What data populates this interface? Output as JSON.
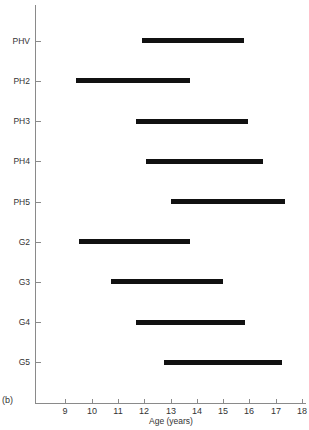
{
  "chart_data": {
    "type": "bar",
    "orientation": "horizontal-range",
    "title": "",
    "panel_label": "(b)",
    "xlabel": "Age (years)",
    "ylabel": "",
    "xlim": [
      8,
      18.1
    ],
    "xticks": [
      9,
      10,
      11,
      12,
      13,
      14,
      15,
      16,
      17,
      18
    ],
    "grid": false,
    "legend": null,
    "categories": [
      "PHV",
      "PH2",
      "PH3",
      "PH4",
      "PH5",
      "G2",
      "G3",
      "G4",
      "G5"
    ],
    "series": [
      {
        "name": "Age range",
        "ranges": [
          {
            "category": "PHV",
            "start": 11.9,
            "end": 15.8
          },
          {
            "category": "PH2",
            "start": 9.4,
            "end": 13.75
          },
          {
            "category": "PH3",
            "start": 11.7,
            "end": 15.95
          },
          {
            "category": "PH4",
            "start": 12.05,
            "end": 16.5
          },
          {
            "category": "PH5",
            "start": 13.0,
            "end": 17.35
          },
          {
            "category": "G2",
            "start": 9.5,
            "end": 13.75
          },
          {
            "category": "G3",
            "start": 10.75,
            "end": 15.0
          },
          {
            "category": "G4",
            "start": 11.7,
            "end": 15.85
          },
          {
            "category": "G5",
            "start": 12.75,
            "end": 17.25
          }
        ]
      }
    ],
    "colors": {
      "bar": "#111111",
      "axis": "#8a8a8a"
    }
  }
}
